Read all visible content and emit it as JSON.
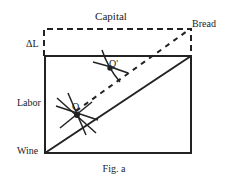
{
  "figure": {
    "caption": "Fig. a",
    "labels": {
      "top": "Capital",
      "top_right": "Bread",
      "left_offset": "ΔL",
      "left": "Labor",
      "bottom_left": "Wine",
      "point_upper": "Q'",
      "point_lower": "Q"
    },
    "colors": {
      "ink": "#222222",
      "background": "#ffffff"
    }
  }
}
